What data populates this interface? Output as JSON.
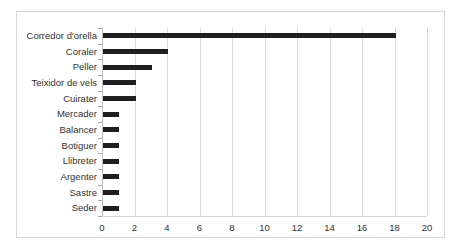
{
  "chart_data": {
    "type": "bar",
    "orientation": "horizontal",
    "title": "",
    "xlabel": "",
    "ylabel": "",
    "categories": [
      "Corredor d'orella",
      "Coraler",
      "Peller",
      "Teixidor de vels",
      "Cuirater",
      "Mercader",
      "Balancer",
      "Botiguer",
      "Llibreter",
      "Argenter",
      "Sastre",
      "Seder"
    ],
    "values": [
      18,
      4,
      3,
      2,
      2,
      1,
      1,
      1,
      1,
      1,
      1,
      1
    ],
    "xlim": [
      0,
      20
    ],
    "xticks": [
      0,
      2,
      4,
      6,
      8,
      10,
      12,
      14,
      16,
      18,
      20
    ],
    "grid": "vertical-major",
    "legend": "none",
    "colors": {
      "bar": "#1f1f1f",
      "gridline": "#dcdcdc",
      "axis": "#c3c3c3",
      "tick_mark": "#ababab",
      "text": "#333333",
      "figure_border": "#d9d9d9",
      "background": "#ffffff"
    }
  }
}
